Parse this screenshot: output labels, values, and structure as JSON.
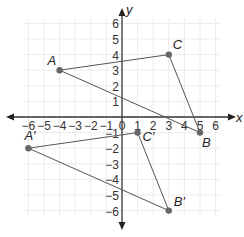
{
  "diagram": {
    "type": "coordinate-plane",
    "axes": {
      "x_label": "x",
      "y_label": "y",
      "x_range": [
        -6,
        6
      ],
      "y_range": [
        -6,
        6
      ],
      "x_ticks": [
        "−6",
        "−5",
        "−4",
        "−3",
        "−2",
        "−1",
        "0",
        "1",
        "2",
        "3",
        "4",
        "5",
        "6"
      ],
      "y_ticks_positive": [
        "1",
        "2",
        "3",
        "4",
        "5",
        "6"
      ],
      "y_ticks_negative": [
        "−1",
        "−2",
        "−3",
        "−4",
        "−5",
        "−6"
      ],
      "grid": true
    },
    "figures": [
      {
        "name": "triangle ABC",
        "points": [
          {
            "label": "A",
            "x": -4,
            "y": 3
          },
          {
            "label": "B",
            "x": 5,
            "y": -1
          },
          {
            "label": "C",
            "x": 3,
            "y": 4
          }
        ]
      },
      {
        "name": "triangle A'B'C'",
        "points": [
          {
            "label": "A′",
            "x": -6,
            "y": -2
          },
          {
            "label": "B′",
            "x": 3,
            "y": -6
          },
          {
            "label": "C′",
            "x": 1,
            "y": -1
          }
        ]
      }
    ],
    "colors": {
      "axis": "#333333",
      "grid": "#ececec",
      "segment": "#555555",
      "point": "#666666"
    }
  }
}
